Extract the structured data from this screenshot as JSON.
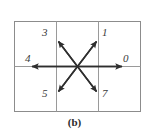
{
  "figure": {
    "caption": "(b)",
    "grid": {
      "columns": 3,
      "rows": 2,
      "border_color": "#8c8c8c",
      "cell_line_color": "#9a9a9a"
    },
    "arrow_color": "#2e2e2e",
    "labels": [
      {
        "id": "label-3",
        "text": "3",
        "direction_name": "up-left-diagonal",
        "cell": "top-center-left"
      },
      {
        "id": "label-1",
        "text": "1",
        "direction_name": "up-right-diagonal",
        "cell": "top-right"
      },
      {
        "id": "label-4",
        "text": "4",
        "direction_name": "left-horizontal",
        "cell": "middle-left"
      },
      {
        "id": "label-0",
        "text": "0",
        "direction_name": "right-horizontal",
        "cell": "middle-right"
      },
      {
        "id": "label-5",
        "text": "5",
        "direction_name": "down-left-diagonal",
        "cell": "bottom-center-left"
      },
      {
        "id": "label-7",
        "text": "7",
        "direction_name": "down-right-diagonal",
        "cell": "bottom-right"
      }
    ],
    "arrows": [
      {
        "name": "horizontal-double-arrow",
        "from": "right-edge",
        "to": "left-edge",
        "style": "double-headed"
      },
      {
        "name": "diagonal-double-arrow-nw-se",
        "from": "upper-left",
        "to": "lower-right",
        "style": "double-headed"
      },
      {
        "name": "diagonal-double-arrow-ne-sw",
        "from": "upper-right",
        "to": "lower-left",
        "style": "double-headed"
      }
    ]
  }
}
